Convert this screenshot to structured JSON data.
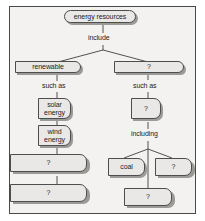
{
  "diagram": {
    "type": "hierarchy-concept-map",
    "colors": {
      "frame_border": "#4a4a4a",
      "frame_background": "#f3f2f0",
      "node_fill": "#e9e8e6",
      "node_border": "#4d4d4d",
      "shadow": "#9c9a97",
      "text": "#1b1b1b"
    },
    "root": {
      "label": "energy resources"
    },
    "connectors": [
      {
        "label": "include"
      },
      {
        "label": "such as"
      },
      {
        "label": "such as"
      },
      {
        "label": "including"
      }
    ],
    "nodes": {
      "root": "energy resources",
      "include_label": "include",
      "left_branch": "renewable",
      "right_branch": "?",
      "left_such_as": "such as",
      "right_such_as": "such as",
      "solar": "solar energy",
      "solar_line1": "solar",
      "solar_line2": "energy",
      "wind": "wind energy",
      "wind_line1": "wind",
      "wind_line2": "energy",
      "left_q1": "?",
      "left_q2": "?",
      "right_q_mid": "?",
      "including_label": "including",
      "coal": "coal",
      "right_q_side": "?",
      "right_q_bottom": "?"
    }
  }
}
